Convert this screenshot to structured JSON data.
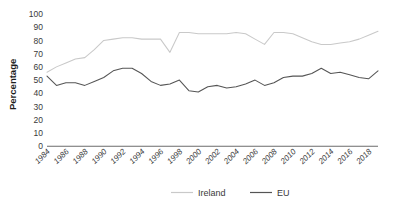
{
  "chart_data": {
    "type": "line",
    "title": "",
    "subtitle": "",
    "xlabel": "",
    "ylabel": "Percentage",
    "ylim": [
      0,
      100
    ],
    "y_ticks": [
      0,
      10,
      20,
      30,
      40,
      50,
      60,
      70,
      80,
      90,
      100
    ],
    "grid": false,
    "legend_position": "bottom",
    "x": [
      1984,
      1985,
      1986,
      1987,
      1988,
      1989,
      1990,
      1991,
      1992,
      1993,
      1994,
      1995,
      1996,
      1997,
      1998,
      1999,
      2000,
      2001,
      2002,
      2003,
      2004,
      2005,
      2006,
      2007,
      2008,
      2009,
      2010,
      2011,
      2012,
      2013,
      2014,
      2015,
      2016,
      2017,
      2018,
      2019
    ],
    "x_tick_labels": [
      "1984",
      "1986",
      "1988",
      "1990",
      "1992",
      "1994",
      "1996",
      "1998",
      "2000",
      "2002",
      "2004",
      "2006",
      "2008",
      "2010",
      "2012",
      "2014",
      "2016",
      "2018"
    ],
    "series": [
      {
        "name": "Ireland",
        "color": "#c9c9c9",
        "values": [
          56,
          60,
          63,
          66,
          67,
          73,
          80,
          81,
          82,
          82,
          81,
          81,
          81,
          71,
          86,
          86,
          85,
          85,
          85,
          85,
          86,
          85,
          81,
          77,
          86,
          86,
          85,
          82,
          79,
          77,
          77,
          78,
          79,
          81,
          84,
          87
        ]
      },
      {
        "name": "EU",
        "color": "#555555",
        "values": [
          53,
          46,
          48,
          48,
          46,
          49,
          52,
          57,
          59,
          59,
          55,
          49,
          46,
          47,
          50,
          42,
          41,
          45,
          46,
          44,
          45,
          47,
          50,
          46,
          48,
          52,
          53,
          53,
          55,
          59,
          55,
          56,
          54,
          52,
          51,
          57
        ]
      }
    ],
    "ireland_extra": [
      63,
      63,
      62,
      63,
      62,
      64,
      67,
      67,
      60,
      67
    ]
  },
  "legend": {
    "items": [
      {
        "label": "Ireland",
        "color": "#c9c9c9"
      },
      {
        "label": "EU",
        "color": "#555555"
      }
    ]
  },
  "axis": {
    "y_title": "Percentage"
  }
}
